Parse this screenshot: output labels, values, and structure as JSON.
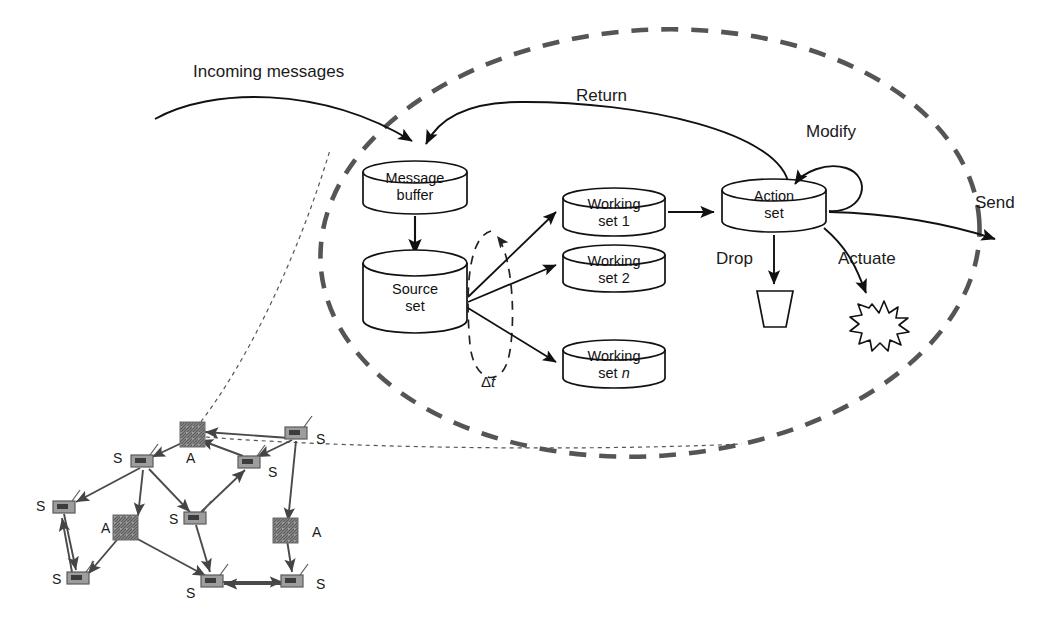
{
  "figure": {
    "background": "#ffffff",
    "ink_color": "#111111",
    "boundary_color": "#555555",
    "node_fill": "#9a9a9a"
  },
  "boundary": {
    "name": "agent-boundary",
    "style": "dashed-ellipse"
  },
  "flow_labels": {
    "incoming": "Incoming messages",
    "return": "Return",
    "modify": "Modify",
    "send": "Send",
    "drop": "Drop",
    "actuate": "Actuate",
    "interval": "Δt"
  },
  "stores": [
    {
      "id": "message-buffer",
      "line1": "Message",
      "line2": "buffer"
    },
    {
      "id": "source-set",
      "line1": "Source",
      "line2": "set"
    },
    {
      "id": "working-set-1",
      "line1": "Working",
      "line2": "set 1"
    },
    {
      "id": "working-set-2",
      "line1": "Working",
      "line2": "set 2"
    },
    {
      "id": "working-set-n",
      "line1": "Working",
      "line2": "set n"
    },
    {
      "id": "action-set",
      "line1": "Action",
      "line2": "set"
    }
  ],
  "sinks": [
    {
      "id": "trash-bin",
      "icon": "trash-bin-icon",
      "label": ""
    },
    {
      "id": "actuator-burst",
      "icon": "burst-icon",
      "label": ""
    }
  ],
  "network": {
    "name": "sensor-actuator-network",
    "sensor_label": "S",
    "actuator_label": "A",
    "nodes": [
      {
        "id": "s1",
        "type": "S",
        "x": 142,
        "y": 461,
        "label": "S",
        "lx": 113,
        "ly": 451
      },
      {
        "id": "a1",
        "type": "A",
        "x": 192,
        "y": 434,
        "label": "A",
        "lx": 186,
        "ly": 451
      },
      {
        "id": "s2",
        "type": "S",
        "x": 249,
        "y": 462,
        "label": "S",
        "lx": 268,
        "ly": 465
      },
      {
        "id": "s3",
        "type": "S",
        "x": 296,
        "y": 433,
        "label": "S",
        "lx": 316,
        "ly": 432
      },
      {
        "id": "s4",
        "type": "S",
        "x": 64,
        "y": 507,
        "label": "S",
        "lx": 36,
        "ly": 499
      },
      {
        "id": "a2",
        "type": "A",
        "x": 125,
        "y": 527,
        "label": "A",
        "lx": 101,
        "ly": 521
      },
      {
        "id": "s5",
        "type": "S",
        "x": 195,
        "y": 518,
        "label": "S",
        "lx": 169,
        "ly": 512
      },
      {
        "id": "a3",
        "type": "A",
        "x": 285,
        "y": 530,
        "label": "A",
        "lx": 312,
        "ly": 525
      },
      {
        "id": "s6",
        "type": "S",
        "x": 78,
        "y": 578,
        "label": "S",
        "lx": 52,
        "ly": 572
      },
      {
        "id": "s7",
        "type": "S",
        "x": 212,
        "y": 581,
        "label": "S",
        "lx": 186,
        "ly": 586
      },
      {
        "id": "s8",
        "type": "S",
        "x": 292,
        "y": 581,
        "label": "S",
        "lx": 316,
        "ly": 577
      }
    ],
    "links": [
      {
        "from": "s2",
        "to": "a1"
      },
      {
        "from": "a1",
        "to": "s3"
      },
      {
        "from": "s3",
        "to": "s2"
      },
      {
        "from": "s2",
        "to": "s4"
      },
      {
        "from": "s2",
        "to": "a2"
      },
      {
        "from": "s2",
        "to": "s5"
      },
      {
        "from": "s5",
        "to": "s3"
      },
      {
        "from": "s4",
        "to": "s6"
      },
      {
        "from": "a2",
        "to": "s6"
      },
      {
        "from": "a2",
        "to": "s7"
      },
      {
        "from": "s5",
        "to": "s7"
      },
      {
        "from": "s3",
        "to": "a3"
      },
      {
        "from": "a3",
        "to": "s8"
      },
      {
        "from": "s7",
        "to": "s8"
      }
    ]
  }
}
